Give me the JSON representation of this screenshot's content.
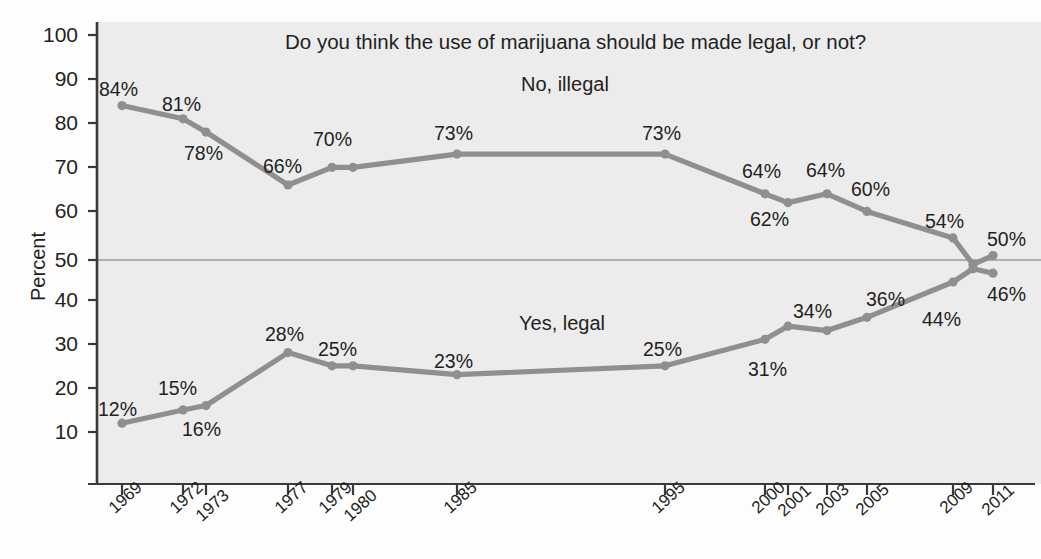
{
  "chart_data": {
    "type": "line",
    "title": "Do you think the use of marijuana should be made legal, or not?",
    "xlabel": "",
    "ylabel": "Percent",
    "ylim": [
      0,
      100
    ],
    "yticks": [
      10,
      20,
      30,
      40,
      50,
      60,
      70,
      80,
      90,
      100
    ],
    "ytick_labels": [
      "10",
      "20",
      "30",
      "40",
      "50",
      "60",
      "70",
      "80",
      "90",
      "100"
    ],
    "x": [
      1969,
      1972,
      1973,
      1977,
      1979,
      1980,
      1985,
      1995,
      2000,
      2001,
      2003,
      2005,
      2009,
      2010,
      2011
    ],
    "xtick_labels": [
      "1969",
      "1972",
      "1973",
      "1977",
      "1979",
      "1980",
      "1985",
      "1995",
      "2000",
      "2001",
      "2003",
      "2005",
      "2009",
      "2011"
    ],
    "grid": false,
    "reference_line": 50,
    "legend_position": "inline-annotation",
    "series": [
      {
        "name": "No, illegal",
        "color": "#8f8f8f",
        "values": [
          84,
          81,
          78,
          66,
          70,
          70,
          73,
          73,
          64,
          62,
          64,
          60,
          54,
          48,
          50
        ],
        "point_labels": [
          "84%",
          "81%",
          "78%",
          "66%",
          "70%",
          "",
          "73%",
          "73%",
          "64%",
          "62%",
          "64%",
          "60%",
          "54%",
          "",
          "50%"
        ]
      },
      {
        "name": "Yes, legal",
        "color": "#8f8f8f",
        "values": [
          12,
          15,
          16,
          28,
          25,
          25,
          23,
          25,
          31,
          34,
          33,
          36,
          44,
          47,
          46
        ],
        "point_labels": [
          "12%",
          "15%",
          "16%",
          "28%",
          "25%",
          "",
          "23%",
          "25%",
          "31%",
          "34%",
          "",
          "36%",
          "44%",
          "",
          "46%"
        ]
      }
    ],
    "annotations": [
      {
        "text": "No, illegal",
        "near": "upper-series"
      },
      {
        "text": "Yes, legal",
        "near": "lower-series"
      }
    ]
  },
  "axis": {
    "y_title": "Percent",
    "y_tick_labels": [
      "100",
      "90",
      "80",
      "70",
      "60",
      "50",
      "40",
      "30",
      "20",
      "10"
    ],
    "x_tick_labels": [
      "1969",
      "1972",
      "1973",
      "1977",
      "1979",
      "1980",
      "1985",
      "1995",
      "2000",
      "2001",
      "2003",
      "2005",
      "2009",
      "2011"
    ]
  },
  "labels": {
    "title": "Do you think the use of marijuana should be made legal, or not?",
    "upper_series": "No, illegal",
    "lower_series": "Yes, legal",
    "upper_points": [
      "84%",
      "81%",
      "78%",
      "66%",
      "70%",
      "73%",
      "73%",
      "64%",
      "62%",
      "64%",
      "60%",
      "54%",
      "50%"
    ],
    "lower_points": [
      "12%",
      "15%",
      "16%",
      "28%",
      "25%",
      "23%",
      "25%",
      "31%",
      "34%",
      "36%",
      "44%",
      "46%"
    ]
  },
  "colors": {
    "line": "#8f8f8f",
    "plot_background": "#ececec",
    "axis": "#3a3a3a",
    "reference_line": "#9a9a9a",
    "text": "#231f20"
  }
}
